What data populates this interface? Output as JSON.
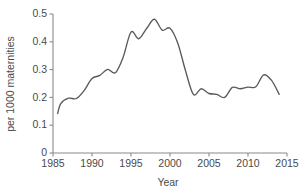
{
  "chart_data": {
    "type": "line",
    "title": "",
    "subtitle": "",
    "xlabel": "Year",
    "ylabel": "per 1000 maternities",
    "xlim": [
      1985,
      2015
    ],
    "ylim": [
      0,
      0.5
    ],
    "grid": false,
    "legend": "none",
    "xticks": [
      1985,
      1990,
      1995,
      2000,
      2005,
      2010,
      2015
    ],
    "xtick_labels": [
      "1985",
      "1990",
      "1995",
      "2000",
      "2005",
      "2010",
      "2015"
    ],
    "yticks": [
      0,
      0.1,
      0.2,
      0.3,
      0.4,
      0.5
    ],
    "ytick_labels": [
      "0",
      "0.1",
      "0.2",
      "0.3",
      "0.4",
      "0.5"
    ],
    "line_color": "#5a5a5a",
    "axis_color": "#8a8a8a",
    "x": [
      1985.6,
      1986,
      1987,
      1988,
      1989,
      1990,
      1991,
      1992,
      1993,
      1994,
      1995,
      1996,
      1997,
      1998,
      1999,
      2000,
      2001,
      2002,
      2003,
      2004,
      2005,
      2006,
      2007,
      2008,
      2009,
      2010,
      2011,
      2012,
      2013,
      2014
    ],
    "series": [
      {
        "name": "rate",
        "values": [
          0.142,
          0.178,
          0.197,
          0.196,
          0.225,
          0.268,
          0.279,
          0.301,
          0.289,
          0.345,
          0.435,
          0.411,
          0.448,
          0.481,
          0.442,
          0.449,
          0.395,
          0.295,
          0.211,
          0.231,
          0.214,
          0.211,
          0.2,
          0.236,
          0.231,
          0.237,
          0.238,
          0.281,
          0.262,
          0.211
        ]
      }
    ]
  }
}
